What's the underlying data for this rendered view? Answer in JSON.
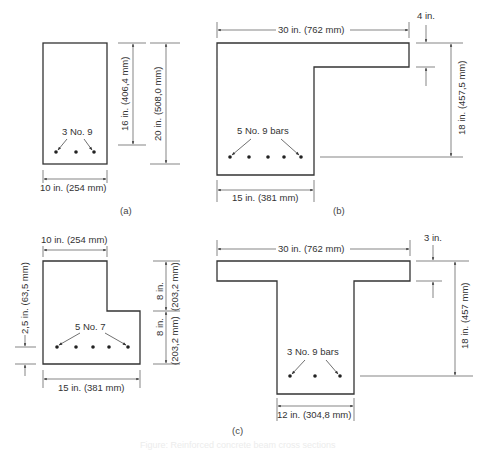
{
  "figure": {
    "footer_caption": "Figure: Reinforced concrete beam cross sections",
    "panels": [
      {
        "id": "a",
        "label": "(a)",
        "shape": "rectangular",
        "reinforcement": "3 No. 9",
        "bar_count": 3,
        "width_dim": "10 in. (254 mm)",
        "effective_depth_dim": "16 in. (406,4 mm)",
        "total_depth_dim": "20 in. (508,0 mm)"
      },
      {
        "id": "b",
        "label": "(b)",
        "shape": "L-beam",
        "reinforcement": "5 No. 9 bars",
        "bar_count": 5,
        "flange_width_dim": "30 in. (762 mm)",
        "flange_thickness_dim": "4 in.",
        "effective_depth_dim": "18 in. (457,5 mm)",
        "web_width_dim": "15 in. (381 mm)"
      },
      {
        "id": "c_left",
        "label": "",
        "shape": "stepped section",
        "reinforcement": "5 No. 7",
        "bar_count": 5,
        "top_width_dim": "10 in. (254 mm)",
        "cover_dim": "2,5 in. (63,5 mm)",
        "upper_height_label": "8 in.",
        "upper_height_mm": "(203,2 mm)",
        "lower_height_label": "8 in.",
        "lower_height_mm": "(203,2 mm)",
        "bottom_width_dim": "15 in. (381 mm)"
      },
      {
        "id": "c",
        "label": "(c)",
        "shape": "T-beam",
        "reinforcement": "3 No. 9 bars",
        "bar_count": 3,
        "flange_width_dim": "30 in. (762 mm)",
        "flange_thickness_dim": "3 in.",
        "effective_depth_dim": "18 in. (457 mm)",
        "web_width_dim": "12 in. (304,8 mm)"
      }
    ]
  },
  "colors": {
    "line": "#333333",
    "text": "#333333",
    "background": "#ffffff"
  }
}
